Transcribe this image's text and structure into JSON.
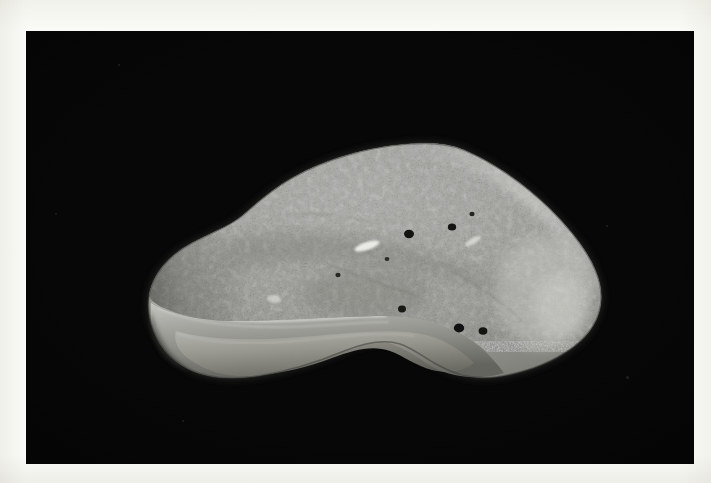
{
  "page": {
    "background_color": "#fbfbf9",
    "caption": ""
  },
  "photograph": {
    "name": "specimen-photograph",
    "kind": "black-and-white photograph",
    "background_color": "#060606",
    "frame": {
      "x": 26,
      "y": 31,
      "width": 668,
      "height": 433
    },
    "subject": {
      "name": "stone-specimen",
      "description": "irregular rounded lithic specimen with granular upper surface and smooth shadowed lower facet",
      "surface_color": "#9d9d9a",
      "highlight_color": "#d8d8d4",
      "shadow_color": "#56564f",
      "bounds": {
        "left": 123,
        "top": 118,
        "right": 576,
        "bottom": 356
      }
    },
    "pits": [
      {
        "name": "pit-1",
        "cx": 383,
        "cy": 203,
        "rx": 5.0,
        "ry": 4.2
      },
      {
        "name": "pit-2",
        "cx": 426,
        "cy": 196,
        "rx": 4.2,
        "ry": 3.6
      },
      {
        "name": "pit-3",
        "cx": 376,
        "cy": 278,
        "rx": 4.0,
        "ry": 3.4
      },
      {
        "name": "pit-4",
        "cx": 433,
        "cy": 297,
        "rx": 5.2,
        "ry": 4.4
      },
      {
        "name": "pit-5",
        "cx": 457,
        "cy": 300,
        "rx": 4.4,
        "ry": 3.8
      },
      {
        "name": "pit-6",
        "cx": 446,
        "cy": 183,
        "rx": 2.6,
        "ry": 2.2
      },
      {
        "name": "pit-7",
        "cx": 312,
        "cy": 244,
        "rx": 2.6,
        "ry": 2.2
      },
      {
        "name": "pit-8",
        "cx": 361,
        "cy": 228,
        "rx": 2.4,
        "ry": 2.0
      }
    ],
    "bright_spots": [
      {
        "name": "bright-streak-1",
        "cx": 341,
        "cy": 215,
        "rx": 13,
        "ry": 4,
        "rot": -18
      },
      {
        "name": "bright-streak-2",
        "cx": 447,
        "cy": 210,
        "rx": 9,
        "ry": 3,
        "rot": -30
      },
      {
        "name": "bright-patch-1",
        "cx": 248,
        "cy": 268,
        "rx": 7,
        "ry": 4,
        "rot": 10
      }
    ],
    "dust_flecks": [
      {
        "name": "dust-fleck-1",
        "x": 92,
        "y": 33,
        "d": 2
      },
      {
        "name": "dust-fleck-2",
        "x": 29,
        "y": 182,
        "d": 2
      },
      {
        "name": "dust-fleck-3",
        "x": 580,
        "y": 194,
        "d": 2
      },
      {
        "name": "dust-fleck-4",
        "x": 600,
        "y": 345,
        "d": 3
      },
      {
        "name": "dust-fleck-5",
        "x": 156,
        "y": 389,
        "d": 2
      }
    ]
  }
}
